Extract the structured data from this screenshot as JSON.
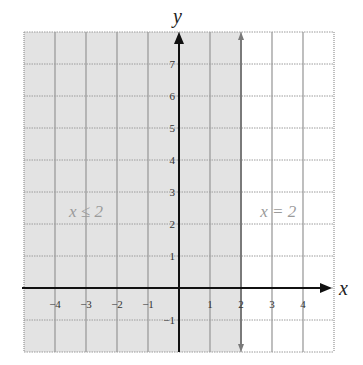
{
  "chart_data": {
    "type": "inequality-graph",
    "title": "",
    "xlabel": "x",
    "ylabel": "y",
    "xlim": [
      -5,
      5
    ],
    "ylim": [
      -2,
      8
    ],
    "grid": true,
    "x_ticks": [
      "-4",
      "-3",
      "-2",
      "-1",
      "1",
      "2",
      "3",
      "4"
    ],
    "x_tick_values": [
      -4,
      -3,
      -2,
      -1,
      1,
      2,
      3,
      4
    ],
    "y_ticks": [
      "7",
      "6",
      "5",
      "4",
      "3",
      "2",
      "1",
      "-1"
    ],
    "y_tick_values": [
      7,
      6,
      5,
      4,
      3,
      2,
      1,
      -1
    ],
    "boundary_line": {
      "equation": "x = 2",
      "x": 2,
      "style": "solid"
    },
    "shaded_region": {
      "inequality": "x ≤ 2",
      "side": "left"
    },
    "annotations": [
      {
        "text": "x ≤ 2",
        "x": -3,
        "y": 2.6
      },
      {
        "text": "x = 2",
        "x": 3.2,
        "y": 2.6
      }
    ]
  },
  "colors": {
    "shade": "#e3e3e3",
    "grid": "#9c9c9c",
    "boundary": "#7a7a7a",
    "axis": "#111111",
    "annotation": "#9a9a9a"
  }
}
